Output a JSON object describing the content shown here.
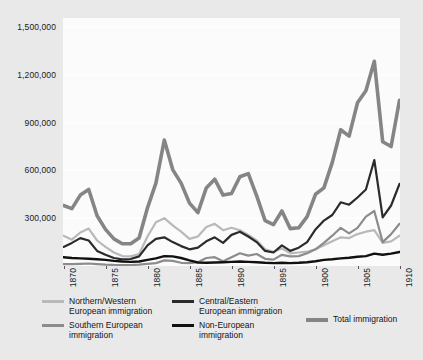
{
  "chart_data": {
    "type": "line",
    "title": "",
    "subtitle": "",
    "xlabel": "",
    "ylabel": "",
    "xlim": [
      1870,
      1910
    ],
    "ylim": [
      0,
      1500000
    ],
    "grid": true,
    "legend_position": "bottom",
    "y_ticks": [
      "1,500,000",
      "1,200,000",
      "900,000",
      "600,000",
      "300,000"
    ],
    "y_tick_values": [
      1500000,
      1200000,
      900000,
      600000,
      300000
    ],
    "x_ticks": [
      "1870",
      "1875",
      "1880",
      "1885",
      "1890",
      "1895",
      "1900",
      "1905",
      "1910"
    ],
    "x_tick_values": [
      1870,
      1875,
      1880,
      1885,
      1890,
      1895,
      1900,
      1905,
      1910
    ],
    "x": [
      1870,
      1871,
      1872,
      1873,
      1874,
      1875,
      1876,
      1877,
      1878,
      1879,
      1880,
      1881,
      1882,
      1883,
      1884,
      1885,
      1886,
      1887,
      1888,
      1889,
      1890,
      1891,
      1892,
      1893,
      1894,
      1895,
      1896,
      1897,
      1898,
      1899,
      1900,
      1901,
      1902,
      1903,
      1904,
      1905,
      1906,
      1907,
      1908,
      1909,
      1910
    ],
    "series": [
      {
        "name": "Northern/Western European immigration",
        "color": "#b9b9b9",
        "width": 2.2,
        "values": [
          190000,
          165000,
          210000,
          235000,
          160000,
          120000,
          85000,
          62000,
          60000,
          75000,
          185000,
          275000,
          300000,
          255000,
          215000,
          170000,
          185000,
          245000,
          265000,
          225000,
          240000,
          225000,
          195000,
          160000,
          105000,
          90000,
          110000,
          80000,
          85000,
          90000,
          105000,
          130000,
          155000,
          180000,
          175000,
          200000,
          215000,
          225000,
          145000,
          155000,
          190000
        ]
      },
      {
        "name": "Southern European immigration",
        "color": "#8c8c8c",
        "width": 2.2,
        "values": [
          12000,
          11000,
          14000,
          16000,
          12000,
          9000,
          7000,
          6000,
          6000,
          8000,
          14000,
          18000,
          35000,
          32000,
          20000,
          18000,
          24000,
          50000,
          55000,
          30000,
          55000,
          80000,
          65000,
          75000,
          45000,
          40000,
          70000,
          60000,
          62000,
          80000,
          105000,
          145000,
          190000,
          240000,
          205000,
          240000,
          310000,
          345000,
          150000,
          200000,
          265000
        ]
      },
      {
        "name": "Central/Eastern European immigration",
        "color": "#2b2b2b",
        "width": 2.2,
        "values": [
          120000,
          145000,
          175000,
          160000,
          95000,
          70000,
          50000,
          42000,
          44000,
          60000,
          130000,
          170000,
          180000,
          150000,
          125000,
          105000,
          115000,
          155000,
          180000,
          145000,
          195000,
          215000,
          185000,
          150000,
          95000,
          85000,
          130000,
          95000,
          115000,
          150000,
          230000,
          285000,
          320000,
          400000,
          385000,
          430000,
          480000,
          665000,
          305000,
          380000,
          515000
        ]
      },
      {
        "name": "Non-European immigration",
        "color": "#111111",
        "width": 2.4,
        "values": [
          55000,
          50000,
          48000,
          45000,
          42000,
          38000,
          32000,
          28000,
          26000,
          28000,
          38000,
          48000,
          62000,
          60000,
          50000,
          35000,
          22000,
          20000,
          22000,
          24000,
          26000,
          28000,
          26000,
          24000,
          20000,
          18000,
          20000,
          18000,
          20000,
          24000,
          30000,
          38000,
          42000,
          48000,
          52000,
          58000,
          62000,
          78000,
          70000,
          78000,
          88000
        ]
      },
      {
        "name": "Total immigration",
        "color": "#858585",
        "width": 3.6,
        "values": [
          380000,
          360000,
          445000,
          480000,
          315000,
          230000,
          170000,
          140000,
          140000,
          175000,
          365000,
          520000,
          790000,
          605000,
          520000,
          395000,
          335000,
          490000,
          545000,
          445000,
          455000,
          560000,
          580000,
          440000,
          285000,
          260000,
          345000,
          235000,
          240000,
          310000,
          450000,
          490000,
          650000,
          855000,
          815000,
          1025000,
          1100000,
          1285000,
          780000,
          750000,
          1040000
        ]
      }
    ]
  },
  "legend": {
    "entries": [
      {
        "label": "Northern/Western\nEuropean immigration",
        "color": "#b9b9b9",
        "thick": false
      },
      {
        "label": "Southern European\nimmigration",
        "color": "#8c8c8c",
        "thick": false
      },
      {
        "label": "Central/Eastern\nEuropean immigration",
        "color": "#2b2b2b",
        "thick": false
      },
      {
        "label": "Non-European\nimmigration",
        "color": "#111111",
        "thick": false
      },
      {
        "label": "Total immigration",
        "color": "#858585",
        "thick": true
      }
    ]
  }
}
